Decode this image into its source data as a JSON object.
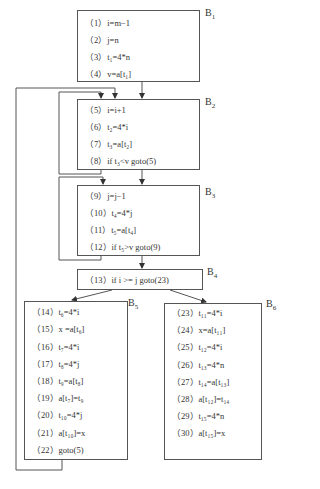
{
  "blocks": {
    "B1": {
      "label": "B",
      "sub": "1",
      "stmts": [
        "（1）i=m−1",
        "（2）j=n",
        "（3）t₁=4*n",
        "（4）v=a[t₁]"
      ]
    },
    "B2": {
      "label": "B",
      "sub": "2",
      "stmts": [
        "（5）i=i+1",
        "（6）t₂=4*i",
        "（7）t₃=a[t₂]",
        "（8）if t₃<v goto(5)"
      ]
    },
    "B3": {
      "label": "B",
      "sub": "3",
      "stmts": [
        "（9）j=j−1",
        "（10）t₄=4*j",
        "（11）t₅=a[t₄]",
        "（12）if t₅>v goto(9)"
      ]
    },
    "B4": {
      "label": "B",
      "sub": "4",
      "stmts": [
        "（13）if i >= j goto(23)"
      ]
    },
    "B5": {
      "label": "B",
      "sub": "5",
      "stmts": [
        "（14）t₆=4*i",
        "（15）x =a[t₆]",
        "（16）t₇=4*i",
        "（17）t₈=4*j",
        "（18）t₉=a[t₈]",
        "（19）a[t₇]=t₉",
        "（20）t₁₀=4*j",
        "（21）a[t₁₀]=x",
        "（22）goto(5)"
      ]
    },
    "B6": {
      "label": "B",
      "sub": "6",
      "stmts": [
        "（23）t₁₁=4*i",
        "（24）x=a[t₁₁]",
        "（25）t₁₂=4*i",
        "（26）t₁₃=4*n",
        "（27）t₁₄=a[t₁₃]",
        "（28）a[t₁₂]=t₁₄",
        "（29）t₁₅=4*n",
        "（30）a[t₁₅]=x"
      ]
    }
  },
  "colors": {
    "line": "#555555",
    "text": "#333333"
  }
}
